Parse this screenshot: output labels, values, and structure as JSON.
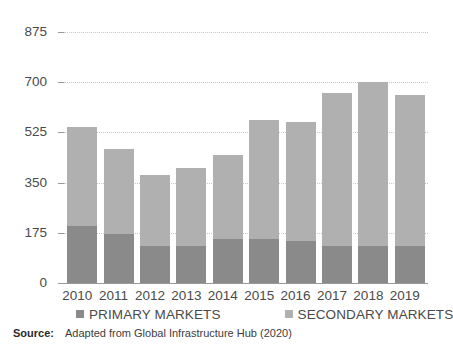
{
  "chart_data": {
    "type": "bar",
    "subtype": "stacked-bar",
    "title": "",
    "xlabel": "",
    "ylabel": "",
    "categories": [
      "2010",
      "2011",
      "2012",
      "2013",
      "2014",
      "2015",
      "2016",
      "2017",
      "2018",
      "2019"
    ],
    "series": [
      {
        "name": "PRIMARY MARKETS",
        "color": "#8a8a8a",
        "values": [
          200,
          172,
          130,
          130,
          154,
          154,
          147,
          130,
          130,
          130
        ]
      },
      {
        "name": "SECONDARY MARKETS",
        "color": "#b0b0b0",
        "values": [
          343,
          294,
          248,
          272,
          294,
          413,
          413,
          532,
          570,
          525
        ]
      }
    ],
    "totals": [
      543,
      466,
      378,
      402,
      448,
      567,
      560,
      662,
      700,
      655
    ],
    "ylim": [
      0,
      875
    ],
    "yticks": [
      0,
      175,
      350,
      525,
      700,
      875
    ],
    "ytick_labels": [
      "0",
      "175",
      "350",
      "525",
      "700",
      "875"
    ],
    "grid": true,
    "legend_position": "bottom"
  },
  "legend": {
    "items": [
      {
        "label": "PRIMARY MARKETS",
        "color": "#8a8a8a"
      },
      {
        "label": "SECONDARY MARKETS",
        "color": "#b0b0b0"
      }
    ]
  },
  "source": {
    "label": "Source:",
    "text": "Adapted from Global Infrastructure Hub (2020)"
  },
  "colors": {
    "primary": "#8a8a8a",
    "secondary": "#b0b0b0",
    "grid": "#c9c9c9",
    "axis": "#9a9a9a",
    "text": "#4a4a4a",
    "background": "#ffffff"
  }
}
